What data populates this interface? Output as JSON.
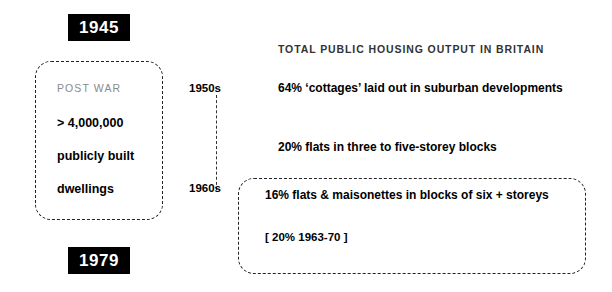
{
  "timeline": {
    "start_year": "1945",
    "end_year": "1979",
    "decades": [
      "1950s",
      "1960s"
    ]
  },
  "postwar_box": {
    "label": "POST WAR",
    "lines": [
      "> 4,000,000",
      "publicly built",
      "dwellings"
    ]
  },
  "output": {
    "title": "TOTAL PUBLIC HOUSING OUTPUT IN BRITAIN",
    "stats": [
      "64% ‘cottages’ laid out in suburban developments",
      "20%  flats in three to five-storey blocks",
      "16% flats & maisonettes in blocks of six + storeys"
    ],
    "note": "[ 20% 1963-70 ]"
  },
  "chart_data": {
    "type": "bar",
    "title": "TOTAL PUBLIC HOUSING OUTPUT IN BRITAIN",
    "categories": [
      "‘cottages’ laid out in suburban developments",
      "flats in three to five-storey blocks",
      "flats & maisonettes in blocks of six + storeys"
    ],
    "values": [
      64,
      20,
      16
    ],
    "xlabel": "",
    "ylabel": "share of output (%)",
    "ylim": [
      0,
      100
    ],
    "annotations": [
      "[ 20% 1963-70 ]"
    ],
    "period": "1945–1979",
    "decades_marked": [
      "1950s",
      "1960s"
    ],
    "grid": false,
    "legend": "none"
  }
}
